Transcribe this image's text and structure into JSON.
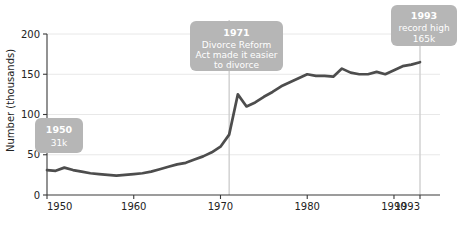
{
  "chart_data": {
    "type": "line",
    "title": "",
    "xlabel": "",
    "ylabel": "Number (thousands)",
    "xlim": [
      1950,
      1993
    ],
    "ylim": [
      0,
      200
    ],
    "grid": true,
    "legend": "none",
    "x_ticks": [
      "1950",
      "1960",
      "1970",
      "1980",
      "1990",
      "1993"
    ],
    "x_tick_values": [
      1950,
      1960,
      1970,
      1980,
      1990,
      1993
    ],
    "y_ticks": [
      "0",
      "50",
      "100",
      "150",
      "200"
    ],
    "y_tick_values": [
      0,
      50,
      100,
      150,
      200
    ],
    "series_name": "Divorces",
    "x": [
      1950,
      1951,
      1952,
      1953,
      1954,
      1955,
      1956,
      1957,
      1958,
      1959,
      1960,
      1961,
      1962,
      1963,
      1964,
      1965,
      1966,
      1967,
      1968,
      1969,
      1970,
      1971,
      1972,
      1973,
      1974,
      1975,
      1976,
      1977,
      1978,
      1979,
      1980,
      1981,
      1982,
      1983,
      1984,
      1985,
      1986,
      1987,
      1988,
      1989,
      1990,
      1991,
      1992,
      1993
    ],
    "values": [
      31,
      30,
      34,
      31,
      29,
      27,
      26,
      25,
      24,
      25,
      26,
      27,
      29,
      32,
      35,
      38,
      40,
      44,
      48,
      53,
      60,
      75,
      125,
      110,
      115,
      122,
      128,
      135,
      140,
      145,
      150,
      148,
      148,
      147,
      157,
      152,
      150,
      150,
      153,
      150,
      155,
      160,
      162,
      165
    ],
    "annotations": [
      {
        "id": "1950-callout",
        "title": "1950",
        "lines": [
          "31k"
        ],
        "year": 1950,
        "value": 31
      },
      {
        "id": "1971-callout",
        "title": "1971",
        "lines": [
          "Divorce Reform",
          "Act made it easier",
          "to divorce"
        ],
        "year": 1971,
        "value": 75
      },
      {
        "id": "1993-callout",
        "title": "1993",
        "lines": [
          "record high",
          "165k"
        ],
        "year": 1993,
        "value": 165
      }
    ],
    "marker_years": [
      1971,
      1993
    ]
  }
}
